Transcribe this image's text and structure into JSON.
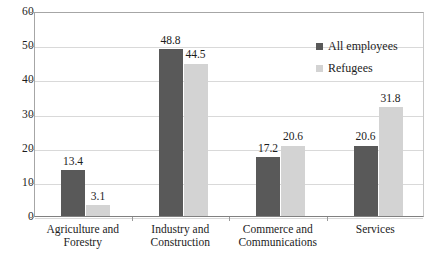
{
  "chart_data": {
    "type": "bar",
    "title": "",
    "subtitle": "",
    "xlabel": "",
    "ylabel": "",
    "ylim": [
      0,
      60
    ],
    "ytick_step": 10,
    "yticks": [
      "0",
      "10",
      "20",
      "30",
      "40",
      "50",
      "60"
    ],
    "grid": true,
    "legend_position": "top-right-inside",
    "categories": [
      "Agriculture and Forestry",
      "Industry and Construction",
      "Commerce and Communications",
      "Services"
    ],
    "category_lines": [
      [
        "Agriculture and",
        "Forestry"
      ],
      [
        "Industry and",
        "Construction"
      ],
      [
        "Commerce and",
        "Communications"
      ],
      [
        "Services"
      ]
    ],
    "series": [
      {
        "name": "All employees",
        "color": "#595959",
        "values": [
          13.4,
          48.8,
          17.2,
          20.6
        ],
        "labels": [
          "13.4",
          "48.8",
          "17.2",
          "20.6"
        ]
      },
      {
        "name": "Refugees",
        "color": "#d3d3d3",
        "values": [
          3.1,
          44.5,
          20.6,
          31.8
        ],
        "labels": [
          "3.1",
          "44.5",
          "20.6",
          "31.8"
        ]
      }
    ]
  },
  "colors": {
    "series_all_employees": "#595959",
    "series_refugees": "#d3d3d3",
    "gridline": "#d9d9d9",
    "axis": "#808080",
    "text": "#1c1c1c",
    "background": "#ffffff"
  }
}
